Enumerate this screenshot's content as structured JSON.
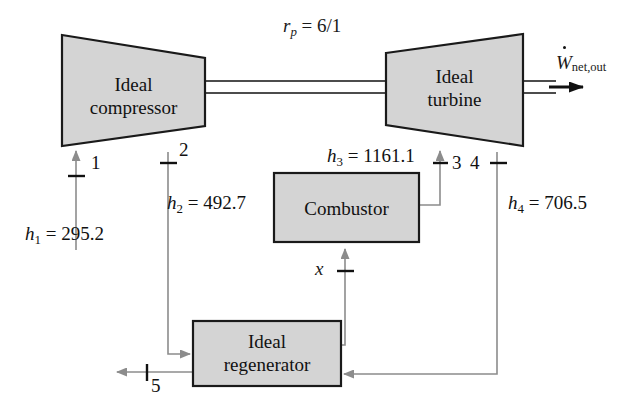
{
  "figure": {
    "type": "process-flow-diagram",
    "background_color": "#ffffff",
    "component_fill": "#d4d4d4",
    "component_stroke": "#1a1a1a",
    "flow_line_color": "#8c8c8c",
    "text_color": "#111111"
  },
  "components": {
    "compressor": {
      "label_line1": "Ideal",
      "label_line2": "compressor",
      "shape": "trapezoid-wide-left"
    },
    "turbine": {
      "label_line1": "Ideal",
      "label_line2": "turbine",
      "shape": "trapezoid-wide-right"
    },
    "combustor": {
      "label": "Combustor",
      "shape": "rectangle"
    },
    "regenerator": {
      "label_line1": "Ideal",
      "label_line2": "regenerator",
      "shape": "rectangle"
    }
  },
  "annotations": {
    "pressure_ratio": {
      "symbol": "r",
      "subscript": "p",
      "equals": "=",
      "value": "6/1",
      "full": "rp = 6/1"
    },
    "work_output": {
      "symbol": "W",
      "has_dot": true,
      "subscript": "net,out",
      "full": "Wnet,out"
    }
  },
  "states": [
    {
      "id": "1",
      "label": "1",
      "enthalpy_symbol": "h",
      "enthalpy_sub": "1",
      "enthalpy_value": "295.2",
      "enthalpy_full": "h1 = 295.2",
      "direction": "up"
    },
    {
      "id": "2",
      "label": "2",
      "enthalpy_symbol": "h",
      "enthalpy_sub": "2",
      "enthalpy_value": "492.7",
      "enthalpy_full": "h2 = 492.7",
      "direction": "down"
    },
    {
      "id": "3",
      "label": "3",
      "enthalpy_symbol": "h",
      "enthalpy_sub": "3",
      "enthalpy_value": "1161.1",
      "enthalpy_full": "h3 = 1161.1",
      "direction": "up"
    },
    {
      "id": "4",
      "label": "4",
      "enthalpy_symbol": "h",
      "enthalpy_sub": "4",
      "enthalpy_value": "706.5",
      "enthalpy_full": "h4 = 706.5",
      "direction": "down"
    },
    {
      "id": "5",
      "label": "5",
      "enthalpy_symbol": null,
      "enthalpy_sub": null,
      "enthalpy_value": null,
      "enthalpy_full": null,
      "direction": "left"
    },
    {
      "id": "x",
      "label": "x",
      "enthalpy_symbol": null,
      "enthalpy_sub": null,
      "enthalpy_value": null,
      "enthalpy_full": null,
      "direction": "up"
    }
  ],
  "flows": [
    {
      "from": "inlet",
      "to": "compressor",
      "state": "1"
    },
    {
      "from": "compressor",
      "to": "regenerator",
      "state": "2"
    },
    {
      "from": "regenerator",
      "to": "combustor",
      "state": "x"
    },
    {
      "from": "combustor",
      "to": "turbine",
      "state": "3"
    },
    {
      "from": "turbine",
      "to": "regenerator",
      "state": "4"
    },
    {
      "from": "regenerator",
      "to": "exhaust",
      "state": "5"
    },
    {
      "from": "compressor",
      "to": "turbine",
      "state": "shaft"
    }
  ]
}
